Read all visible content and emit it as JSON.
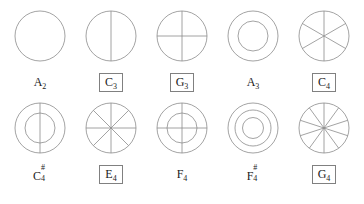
{
  "sheet": {
    "title": "",
    "stroke_color": "#8c8c8c",
    "box_border_color": "#808080",
    "text_color": "#1a1a1a",
    "background": "#ffffff"
  },
  "rows": [
    {
      "name": "top-row",
      "figures": [
        {
          "id": "A2",
          "label_letter": "A",
          "label_sub": "2",
          "label_sup": "",
          "boxed": false,
          "diagram": "plain-circle",
          "rings": 1,
          "diameters": 0,
          "diameter_angles": []
        },
        {
          "id": "C3",
          "label_letter": "C",
          "label_sub": "3",
          "label_sup": "",
          "boxed": true,
          "diagram": "circle-vertical-diameter",
          "rings": 1,
          "diameters": 1,
          "diameter_angles": [
            90
          ]
        },
        {
          "id": "G3",
          "label_letter": "G",
          "label_sub": "3",
          "label_sup": "",
          "boxed": true,
          "diagram": "circle-cross",
          "rings": 1,
          "diameters": 2,
          "diameter_angles": [
            90,
            0
          ]
        },
        {
          "id": "A3",
          "label_letter": "A",
          "label_sub": "3",
          "label_sup": "",
          "boxed": false,
          "diagram": "two-concentric-circles",
          "rings": 2,
          "diameters": 0,
          "diameter_angles": []
        },
        {
          "id": "C4",
          "label_letter": "C",
          "label_sub": "4",
          "label_sup": "",
          "boxed": true,
          "diagram": "circle-six-sectors",
          "rings": 1,
          "diameters": 3,
          "diameter_angles": [
            90,
            30,
            150
          ]
        }
      ]
    },
    {
      "name": "bottom-row",
      "figures": [
        {
          "id": "C4sharp",
          "label_letter": "C",
          "label_sub": "4",
          "label_sup": "#",
          "boxed": false,
          "diagram": "two-concentric-circles-vertical-diameter",
          "rings": 2,
          "diameters": 1,
          "diameter_angles": [
            90
          ]
        },
        {
          "id": "E4",
          "label_letter": "E",
          "label_sub": "4",
          "label_sup": "",
          "boxed": true,
          "diagram": "circle-eight-sectors",
          "rings": 1,
          "diameters": 4,
          "diameter_angles": [
            90,
            45,
            0,
            135
          ]
        },
        {
          "id": "F4",
          "label_letter": "F",
          "label_sub": "4",
          "label_sup": "",
          "boxed": false,
          "diagram": "two-concentric-circles-cross",
          "rings": 2,
          "diameters": 2,
          "diameter_angles": [
            90,
            0
          ]
        },
        {
          "id": "F4sharp",
          "label_letter": "F",
          "label_sub": "4",
          "label_sup": "#",
          "boxed": false,
          "diagram": "three-concentric-circles",
          "rings": 3,
          "diameters": 0,
          "diameter_angles": []
        },
        {
          "id": "G4",
          "label_letter": "G",
          "label_sub": "4",
          "label_sup": "",
          "boxed": true,
          "diagram": "circle-ten-sectors",
          "rings": 1,
          "diameters": 5,
          "diameter_angles": [
            90,
            54,
            18,
            162,
            126
          ]
        }
      ]
    }
  ]
}
